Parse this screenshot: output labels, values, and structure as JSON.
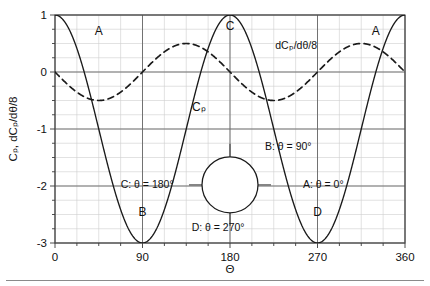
{
  "chart_data": {
    "type": "line",
    "title": "",
    "xlabel": "Θ",
    "ylabel": "Cₚ, dCₚ/dθ/8",
    "xlim": [
      0,
      360
    ],
    "ylim": [
      -3,
      1
    ],
    "grid": true,
    "xticks": [
      0,
      90,
      180,
      270,
      360
    ],
    "xtick_labels": [
      "0",
      "90",
      "180",
      "270",
      "360"
    ],
    "xminor_step": 22.5,
    "yticks": [
      1,
      0,
      -1,
      -2,
      -3
    ],
    "ytick_labels": [
      "1",
      "0",
      "-1",
      "-2",
      "-3"
    ],
    "yminor_step": 0.25,
    "legend_position": "none",
    "series": [
      {
        "name": "Cₚ",
        "style": "solid",
        "color": "#1a1a1a",
        "formula": "1 - 4*sin(theta)^2",
        "x": [
          0,
          10,
          20,
          30,
          40,
          50,
          60,
          70,
          80,
          90,
          100,
          110,
          120,
          130,
          140,
          150,
          160,
          170,
          180,
          190,
          200,
          210,
          220,
          230,
          240,
          250,
          260,
          270,
          280,
          290,
          300,
          310,
          320,
          330,
          340,
          350,
          360
        ],
        "values": [
          1.0,
          0.879,
          0.532,
          0.0,
          -0.653,
          -1.347,
          -2.0,
          -2.532,
          -2.879,
          -3.0,
          -2.879,
          -2.532,
          -2.0,
          -1.347,
          -0.653,
          0.0,
          0.532,
          0.879,
          1.0,
          0.879,
          0.532,
          0.0,
          -0.653,
          -1.347,
          -2.0,
          -2.532,
          -2.879,
          -3.0,
          -2.879,
          -2.532,
          -2.0,
          -1.347,
          -0.653,
          0.0,
          0.532,
          0.879,
          1.0
        ]
      },
      {
        "name": "dCₚ/dθ/8",
        "style": "dashed",
        "color": "#1a1a1a",
        "formula": "-0.5*sin(2*theta)",
        "x": [
          0,
          10,
          20,
          30,
          40,
          50,
          60,
          70,
          80,
          90,
          100,
          110,
          120,
          130,
          140,
          150,
          160,
          170,
          180,
          190,
          200,
          210,
          220,
          230,
          240,
          250,
          260,
          270,
          280,
          290,
          300,
          310,
          320,
          330,
          340,
          350,
          360
        ],
        "values": [
          0.0,
          -0.171,
          -0.321,
          -0.433,
          -0.492,
          -0.492,
          -0.433,
          -0.321,
          -0.171,
          0.0,
          0.171,
          0.321,
          0.433,
          0.492,
          0.492,
          0.433,
          0.321,
          0.171,
          0.0,
          -0.171,
          -0.321,
          -0.433,
          -0.492,
          -0.492,
          -0.433,
          -0.321,
          -0.171,
          0.0,
          0.171,
          0.321,
          0.433,
          0.492,
          0.492,
          0.433,
          0.321,
          0.171,
          0.0
        ]
      }
    ],
    "annotations": [
      {
        "key": "pointA1",
        "text": "A",
        "x": 45,
        "y": 0.72
      },
      {
        "key": "pointB",
        "text": "B",
        "x": 90,
        "y": -2.45
      },
      {
        "key": "pointC",
        "text": "C",
        "x": 180,
        "y": 0.8
      },
      {
        "key": "pointD",
        "text": "D",
        "x": 270,
        "y": -2.45
      },
      {
        "key": "pointA2",
        "text": "A",
        "x": 330,
        "y": 0.72
      },
      {
        "key": "cpLabel",
        "text": "Cₚ",
        "x": 148,
        "y": -0.62
      },
      {
        "key": "dcpLabel",
        "text": "dCₚ/dθ/8",
        "x": 248,
        "y": 0.47
      },
      {
        "key": "legA",
        "text": "A: θ = 0°",
        "x": 255,
        "y": -1.97
      },
      {
        "key": "legB",
        "text": "B: θ = 90°",
        "x": 216,
        "y": -1.3
      },
      {
        "key": "legC",
        "text": "C: θ = 180°",
        "x": 122,
        "y": -1.97
      },
      {
        "key": "legD",
        "text": "D: θ = 270°",
        "x": 195,
        "y": -2.72
      }
    ],
    "inset": {
      "name": "cylinder-cross-section",
      "shape": "circle",
      "center_x": 180,
      "center_y": -1.98,
      "radius_px": 28,
      "leaders": [
        "top-to-B",
        "bottom-to-D",
        "left-to-C",
        "right-to-A"
      ]
    }
  },
  "figure": {
    "axis_label_x": "Θ",
    "axis_label_y": "Cₚ, dCₚ/dθ/8"
  }
}
